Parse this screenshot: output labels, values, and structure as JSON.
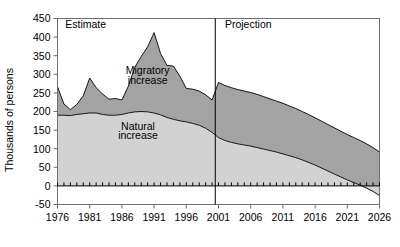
{
  "chart_data": {
    "type": "area",
    "title": "",
    "subtitle": "",
    "xlabel": "",
    "ylabel": "Thousands of persons",
    "stacked": true,
    "grid": false,
    "legend_position": "inline-annotation",
    "xlim": [
      1976,
      2026
    ],
    "ylim": [
      -50,
      450
    ],
    "ytick_values": [
      -50,
      0,
      50,
      100,
      150,
      200,
      250,
      300,
      350,
      400,
      450
    ],
    "ytick_labels": [
      "-50",
      "0",
      "50",
      "100",
      "150",
      "200",
      "250",
      "300",
      "350",
      "400",
      "450"
    ],
    "xtick_values": [
      1976,
      1981,
      1986,
      1991,
      1996,
      2001,
      2006,
      2011,
      2016,
      2021,
      2026
    ],
    "xtick_labels": [
      "1976",
      "1981",
      "1986",
      "1991",
      "1996",
      "2001",
      "2006",
      "2011",
      "2016",
      "2021",
      "2026"
    ],
    "minor_xticks_interval": 1,
    "colors": {
      "natural_increase": "#d2d2d2",
      "migratory_increase": "#a3a3a3",
      "line": "#000000",
      "axis": "#6e6e6e",
      "text": "#000000",
      "background": "#ffffff"
    },
    "annotations": [
      {
        "name": "estimate-label",
        "text": "Estimate",
        "x": 1977.2,
        "y": 425
      },
      {
        "name": "projection-label",
        "text": "Projection",
        "x": 2002.0,
        "y": 425
      },
      {
        "name": "migratory-increase-label",
        "text": "Migratory",
        "x": 1990.0,
        "y": 300
      },
      {
        "name": "migratory-increase-label-2",
        "text": "increase",
        "x": 1990.0,
        "y": 275
      },
      {
        "name": "natural-increase-label",
        "text": "Natural",
        "x": 1988.5,
        "y": 150
      },
      {
        "name": "natural-increase-label-2",
        "text": "increase",
        "x": 1988.5,
        "y": 125
      }
    ],
    "divider": {
      "name": "estimate-projection-divider",
      "x": 2000.5,
      "label_left": "Estimate",
      "label_right": "Projection"
    },
    "x": [
      1976,
      1977,
      1978,
      1979,
      1980,
      1981,
      1982,
      1983,
      1984,
      1985,
      1986,
      1987,
      1988,
      1989,
      1990,
      1991,
      1992,
      1993,
      1994,
      1995,
      1996,
      1997,
      1998,
      1999,
      2000,
      2001,
      2002,
      2003,
      2004,
      2005,
      2006,
      2007,
      2008,
      2009,
      2010,
      2011,
      2012,
      2013,
      2014,
      2015,
      2016,
      2017,
      2018,
      2019,
      2020,
      2021,
      2022,
      2023,
      2024,
      2025,
      2026
    ],
    "series": [
      {
        "name": "Natural increase",
        "values": [
          190,
          190,
          189,
          192,
          194,
          196,
          196,
          192,
          190,
          190,
          192,
          196,
          199,
          200,
          199,
          196,
          191,
          184,
          179,
          175,
          172,
          168,
          163,
          155,
          144,
          130,
          122,
          117,
          113,
          110,
          107,
          103,
          99,
          95,
          91,
          86,
          81,
          76,
          70,
          63,
          56,
          48,
          40,
          32,
          24,
          16,
          9,
          2,
          -6,
          -15,
          -26
        ]
      },
      {
        "name": "Migratory increase",
        "values": [
          77,
          30,
          16,
          27,
          48,
          94,
          68,
          55,
          43,
          45,
          39,
          72,
          120,
          148,
          175,
          216,
          165,
          140,
          143,
          120,
          90,
          92,
          92,
          90,
          87,
          148,
          148,
          147,
          146,
          145,
          144,
          143,
          141,
          139,
          137,
          136,
          134,
          132,
          130,
          129,
          127,
          126,
          125,
          124,
          123,
          122,
          121,
          120,
          119,
          118,
          117
        ]
      }
    ],
    "total_values": [
      267,
      220,
      205,
      219,
      242,
      290,
      264,
      247,
      233,
      235,
      231,
      268,
      319,
      348,
      374,
      412,
      356,
      324,
      322,
      295,
      262,
      260,
      255,
      245,
      231,
      278,
      270,
      264,
      259,
      255,
      251,
      246,
      240,
      234,
      228,
      222,
      215,
      208,
      200,
      192,
      183,
      174,
      165,
      156,
      147,
      138,
      130,
      122,
      113,
      103,
      91
    ]
  }
}
